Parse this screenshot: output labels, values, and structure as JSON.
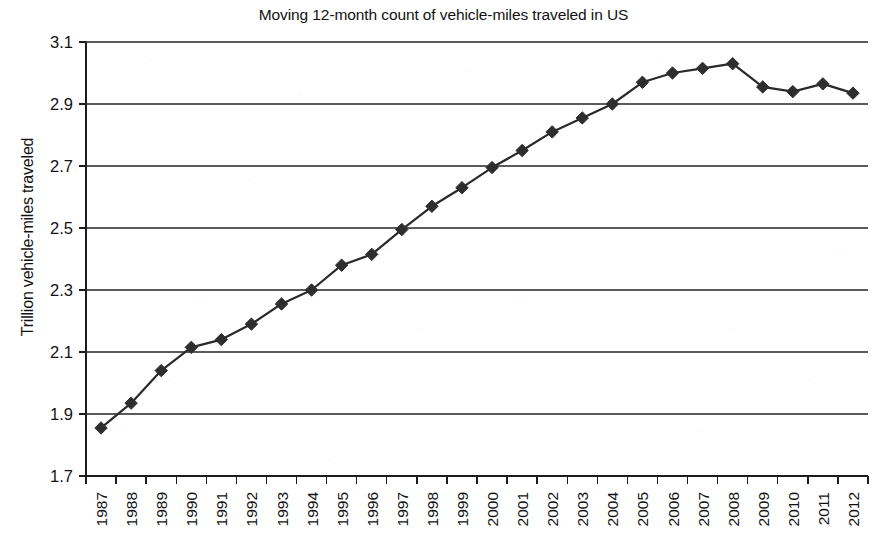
{
  "chart_data": {
    "type": "line",
    "title": "Moving 12-month count of vehicle-miles traveled in US",
    "xlabel": "",
    "ylabel": "Trillion vehicle-miles traveled",
    "ylim": [
      1.7,
      3.1
    ],
    "ytick_step": 0.2,
    "ytick_labels": [
      "3.1",
      "2.9",
      "2.7",
      "2.5",
      "2.3",
      "2.1",
      "1.9",
      "1.7"
    ],
    "yticks": [
      3.1,
      2.9,
      2.7,
      2.5,
      2.3,
      2.1,
      1.9,
      1.7
    ],
    "grid": true,
    "grid_axis": "y",
    "legend": false,
    "marker": "diamond",
    "categories": [
      "1987",
      "1988",
      "1989",
      "1990",
      "1991",
      "1992",
      "1993",
      "1994",
      "1995",
      "1996",
      "1997",
      "1998",
      "1999",
      "2000",
      "2001",
      "2002",
      "2003",
      "2004",
      "2005",
      "2006",
      "2007",
      "2008",
      "2009",
      "2010",
      "2011",
      "2012"
    ],
    "values": [
      1.855,
      1.935,
      2.04,
      2.115,
      2.14,
      2.19,
      2.255,
      2.3,
      2.38,
      2.415,
      2.495,
      2.57,
      2.63,
      2.695,
      2.75,
      2.81,
      2.855,
      2.9,
      2.97,
      3.0,
      3.015,
      3.03,
      2.955,
      2.94,
      2.965,
      2.935
    ],
    "series": [
      {
        "name": "Trillion vehicle-miles traveled",
        "color": "#2e2e2e",
        "values": [
          1.855,
          1.935,
          2.04,
          2.115,
          2.14,
          2.19,
          2.255,
          2.3,
          2.38,
          2.415,
          2.495,
          2.57,
          2.63,
          2.695,
          2.75,
          2.81,
          2.855,
          2.9,
          2.97,
          3.0,
          3.015,
          3.03,
          2.955,
          2.94,
          2.965,
          2.935
        ]
      }
    ]
  },
  "colors": {
    "series": "#2e2e2e",
    "gridline": "#5b5b5b",
    "axis": "#1c1c1c",
    "background": "#ffffff",
    "text": "#121212"
  }
}
